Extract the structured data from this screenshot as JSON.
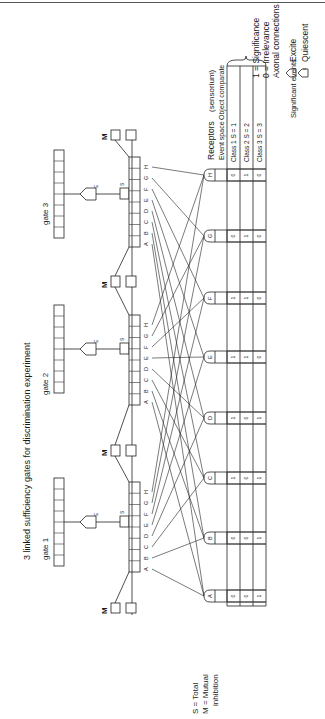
{
  "figure": {
    "title": "3 linked sufficiency gates for discrimination experiment",
    "orientation": "rotated 90 degrees counter-clockwise"
  },
  "legend": {
    "significance": "1 = Significance",
    "irrelevance": "0 = Irrelevance",
    "axonal_connections": "Axonal connections",
    "excite_label": "Excite",
    "excite_symbol": "1",
    "quiescent_label": "Quiescent",
    "quiescent_symbol": "0"
  },
  "footnote": {
    "total": "S = Total",
    "mutual": "M = Mutual",
    "inhibition": "inhibition"
  },
  "gates": [
    {
      "label": "gate 1",
      "excite_tag": "E",
      "sum_tag": "S"
    },
    {
      "label": "gate 2",
      "excite_tag": "E",
      "sum_tag": "S"
    },
    {
      "label": "gate 3",
      "excite_tag": "E",
      "sum_tag": "S"
    }
  ],
  "input_letters": [
    "A",
    "B",
    "C",
    "D",
    "E",
    "F",
    "G",
    "H"
  ],
  "mutual_inhibition_label": "M",
  "receptors": {
    "header": "Receptors",
    "subheader": "(sensorium)",
    "event_space": "Event space",
    "object_comparate": "Object comparate",
    "classes": [
      {
        "label": "Class 1 S = 1"
      },
      {
        "label": "Class 2 S = 2"
      },
      {
        "label": "Class 3 S = 3"
      }
    ],
    "significant_events": "Significant events",
    "nodes": [
      {
        "id": "A",
        "values": [
          "0",
          "0",
          "1"
        ]
      },
      {
        "id": "B",
        "values": [
          "0",
          "0",
          "1"
        ]
      },
      {
        "id": "C",
        "values": [
          "1",
          "0",
          "1"
        ]
      },
      {
        "id": "D",
        "values": [
          "1",
          "0",
          "1"
        ]
      },
      {
        "id": "E",
        "values": [
          "1",
          "1",
          "0"
        ]
      },
      {
        "id": "F",
        "values": [
          "1",
          "1",
          "0"
        ]
      },
      {
        "id": "G",
        "values": [
          "0",
          "1",
          "0"
        ]
      },
      {
        "id": "H",
        "values": [
          "0",
          "1",
          "0"
        ]
      }
    ]
  }
}
